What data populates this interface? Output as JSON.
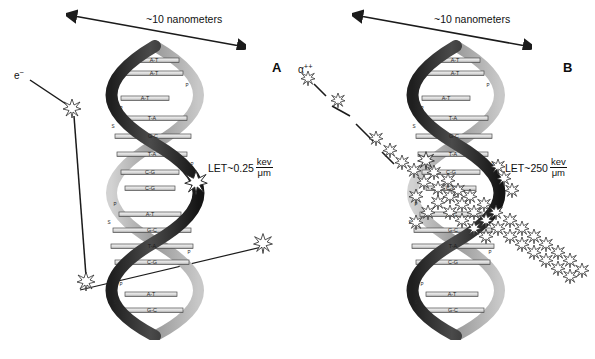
{
  "figure": {
    "background_color": "#ffffff",
    "width": 595,
    "height": 359
  },
  "colors": {
    "ribbon_dark": "#2e2e2e",
    "ribbon_mid": "#6b6b6b",
    "ribbon_light": "#b9b9b9",
    "rung_fill": "#e8e8e8",
    "rung_stroke": "#4a4a4a",
    "text": "#111111",
    "track": "#1b1b1b",
    "star_fill": "#ffffff",
    "star_stroke": "#2b2b2b"
  },
  "panels": [
    {
      "id": "A",
      "letter": "A",
      "scale_label": "~10 nanometers",
      "particle_label": "e",
      "particle_charge": "−",
      "particle_name": "electron",
      "let_prefix": "LET~0.25",
      "let_numerator": "kev",
      "let_denominator": "μm",
      "damage_pattern": "sparse isolated ionizations along a long straight track",
      "ionization_count": 4,
      "base_pairs": [
        "A-T",
        "A-T",
        "A-T",
        "T-A",
        "G-C",
        "T-A",
        "C-G",
        "C-G",
        "A-T",
        "G-C",
        "T-A",
        "C-G",
        "A-T",
        "G-C",
        "T-A"
      ],
      "backbone_labels": [
        "P",
        "S"
      ],
      "track_points": [
        {
          "x": 30,
          "y": 80
        },
        {
          "x": 72,
          "y": 108
        },
        {
          "x": 86,
          "y": 280
        }
      ],
      "ionization_sites": [
        {
          "x": 72,
          "y": 108,
          "size": 10
        },
        {
          "x": 86,
          "y": 281,
          "size": 10
        },
        {
          "x": 196,
          "y": 182,
          "size": 13
        },
        {
          "x": 263,
          "y": 243,
          "size": 11
        }
      ],
      "helix_crossing_line": [
        {
          "x": 80,
          "y": 290
        },
        {
          "x": 268,
          "y": 245
        }
      ]
    },
    {
      "id": "B",
      "letter": "B",
      "scale_label": "~10 nanometers",
      "particle_label": "α",
      "particle_charge": "++",
      "particle_name": "alpha particle",
      "let_prefix": "LET~250",
      "let_numerator": "kev",
      "let_denominator": "μm",
      "damage_pattern": "dense clustered ionizations along a short heavy track",
      "ionization_count": 46,
      "base_pairs": [
        "A-T",
        "A-T",
        "A-T",
        "T-A",
        "G-C",
        "T-A",
        "C-G",
        "C-G",
        "A-T",
        "G-C",
        "T-A",
        "C-G",
        "A-T",
        "G-C",
        "T-A"
      ],
      "backbone_labels": [
        "P",
        "S"
      ],
      "track_points": [
        {
          "x": 10,
          "y": 78
        },
        {
          "x": 22,
          "y": 98
        },
        {
          "x": 48,
          "y": 116
        },
        {
          "x": 78,
          "y": 148
        },
        {
          "x": 100,
          "y": 170
        },
        {
          "x": 128,
          "y": 196
        },
        {
          "x": 160,
          "y": 228
        },
        {
          "x": 196,
          "y": 258
        },
        {
          "x": 232,
          "y": 272
        }
      ]
    }
  ],
  "legend_notes": {
    "P": "phosphate",
    "S": "sugar",
    "star": "ionization / damage event"
  }
}
